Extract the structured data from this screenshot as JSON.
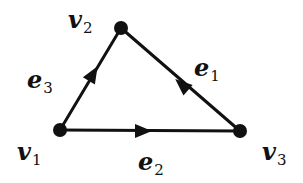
{
  "diagram": {
    "type": "directed-graph",
    "colors": {
      "stroke": "#111111",
      "background": "#ffffff"
    },
    "nodes": [
      {
        "id": "v1",
        "base": "v",
        "sub": "1",
        "x": 60,
        "y": 130
      },
      {
        "id": "v2",
        "base": "v",
        "sub": "2",
        "x": 121,
        "y": 28
      },
      {
        "id": "v3",
        "base": "v",
        "sub": "3",
        "x": 240,
        "y": 131
      }
    ],
    "edges": [
      {
        "id": "e1",
        "base": "e",
        "sub": "1",
        "from": "v3",
        "to": "v2"
      },
      {
        "id": "e2",
        "base": "e",
        "sub": "2",
        "from": "v1",
        "to": "v3"
      },
      {
        "id": "e3",
        "base": "e",
        "sub": "3",
        "from": "v1",
        "to": "v2"
      }
    ]
  }
}
